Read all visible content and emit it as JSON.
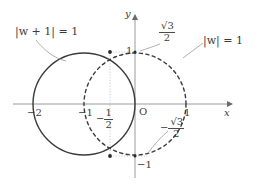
{
  "figure": {
    "type": "complex-plane-circles",
    "axes": {
      "x_axis_label": "x",
      "y_axis_label": "y",
      "origin_label": "O"
    },
    "x_ticks": [
      {
        "value": -2,
        "label": "−2"
      },
      {
        "value": -1,
        "label": "−1"
      },
      {
        "value": 1,
        "label": "1"
      }
    ],
    "y_ticks": [
      {
        "value": 1,
        "label": "1"
      },
      {
        "value": -1,
        "label": "−1"
      }
    ],
    "special_labels": {
      "minus_half_num": "1",
      "minus_half_den": "2",
      "minus_half_sign": "−",
      "sqrt3_over_2_num": "3",
      "sqrt3_over_2_den": "2",
      "neg_sqrt3_over_2_sign": "−"
    },
    "curves": [
      {
        "name": "circle-w-plus-1",
        "equation_parts": [
          "|",
          "w",
          "+ 1",
          "| = 1"
        ],
        "label": "|w + 1| = 1",
        "center": [
          -1,
          0
        ],
        "radius": 1,
        "style": "solid"
      },
      {
        "name": "circle-w",
        "equation_parts": [
          "|",
          "w",
          "| = 1"
        ],
        "label": "|w| = 1",
        "center": [
          0,
          0
        ],
        "radius": 1,
        "style": "dashed"
      }
    ],
    "intersection_points": [
      {
        "x": -0.5,
        "y": 0.8660254
      },
      {
        "x": -0.5,
        "y": -0.8660254
      }
    ],
    "colors": {
      "axis": "#9a9a9a",
      "curve": "#3a3a3a",
      "guide": "#b5b5b5",
      "text": "#3a3a3a"
    }
  }
}
